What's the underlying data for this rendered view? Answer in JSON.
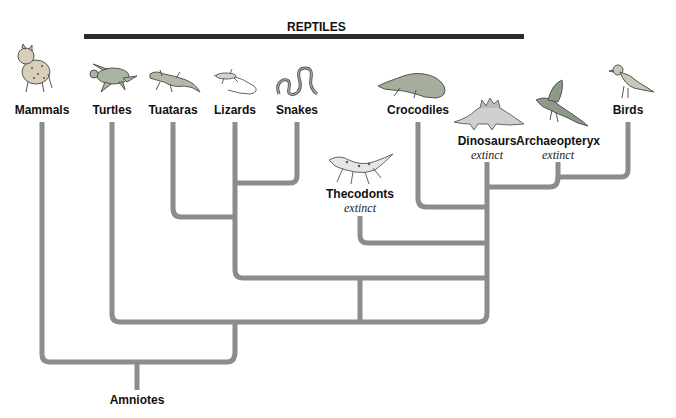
{
  "diagram": {
    "type": "cladogram",
    "group_label": "REPTILES",
    "root_label": "Amniotes",
    "line_color": "#8c8c8c",
    "bar_color": "#2b2b2b",
    "taxa": [
      {
        "name": "Mammals",
        "status": "",
        "icon": "lynx-icon"
      },
      {
        "name": "Turtles",
        "status": "",
        "icon": "turtle-icon"
      },
      {
        "name": "Tuataras",
        "status": "",
        "icon": "tuatara-icon"
      },
      {
        "name": "Lizards",
        "status": "",
        "icon": "lizard-icon"
      },
      {
        "name": "Snakes",
        "status": "",
        "icon": "snake-icon"
      },
      {
        "name": "Thecodonts",
        "status": "extinct",
        "icon": "thecodont-icon"
      },
      {
        "name": "Crocodiles",
        "status": "",
        "icon": "crocodile-icon"
      },
      {
        "name": "Dinosaurs",
        "status": "extinct",
        "icon": "stegosaurus-icon"
      },
      {
        "name": "Archaeopteryx",
        "status": "extinct",
        "icon": "archaeopteryx-icon"
      },
      {
        "name": "Birds",
        "status": "",
        "icon": "bird-icon"
      }
    ],
    "topology": "(Mammals,(Turtles,((Tuataras,(Lizards,Snakes)),(Thecodonts,(Crocodiles,(Dinosaurs,(Archaeopteryx,Birds)))))))"
  }
}
